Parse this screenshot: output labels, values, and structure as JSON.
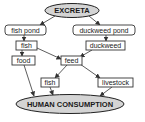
{
  "diagram": {
    "type": "flowchart",
    "nodes": {
      "excreta": "EXCRETA",
      "fish_pond": "fish pond",
      "duckweed_pond": "duckweed pond",
      "fish_top": "fish",
      "duckweed": "duckweed",
      "food": "food",
      "feed": "feed",
      "fish_bottom": "fish",
      "livestock": "livestock",
      "human_consumption": "HUMAN CONSUMPTION"
    },
    "edges": [
      {
        "from": "EXCRETA",
        "to": "fish pond"
      },
      {
        "from": "EXCRETA",
        "to": "duckweed pond"
      },
      {
        "from": "fish pond",
        "to": "fish"
      },
      {
        "from": "duckweed pond",
        "to": "duckweed"
      },
      {
        "from": "fish",
        "to": "food"
      },
      {
        "from": "fish",
        "to": "feed"
      },
      {
        "from": "duckweed",
        "to": "feed"
      },
      {
        "from": "feed",
        "to": "fish"
      },
      {
        "from": "feed",
        "to": "livestock"
      },
      {
        "from": "food",
        "to": "HUMAN CONSUMPTION"
      },
      {
        "from": "fish",
        "to": "HUMAN CONSUMPTION"
      },
      {
        "from": "livestock",
        "to": "HUMAN CONSUMPTION"
      }
    ],
    "colors": {
      "ellipse_fill": "#d4d4d4",
      "stroke": "#333333",
      "box_fill": "#ffffff"
    }
  }
}
